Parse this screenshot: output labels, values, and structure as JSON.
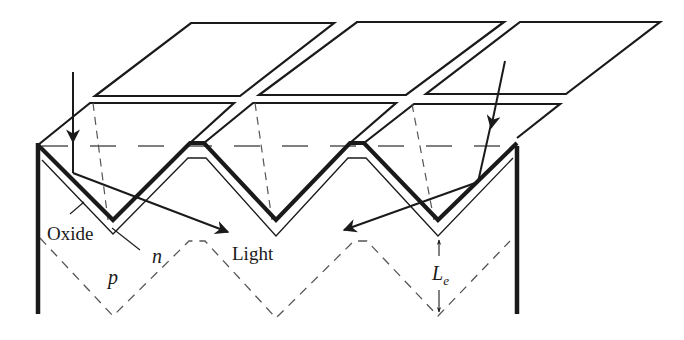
{
  "diagram": {
    "labels": {
      "oxide": "Oxide",
      "n_region": "n",
      "p_region": "p",
      "light": "Light",
      "diffusion_length_main": "L",
      "diffusion_length_sub": "e"
    },
    "elements": [
      "top-glass-plates-row-1",
      "top-glass-plates-row-2",
      "textured-surface-thick-zigzag",
      "oxide-layer-thin-zigzag",
      "pn-junction-dashed-zigzag",
      "horizontal-dashed-reference-line",
      "left-side-wall",
      "right-side-wall",
      "incident-light-ray-left",
      "incident-light-ray-right",
      "diffusion-length-arrows"
    ],
    "colors": {
      "stroke": "#1a1a1a",
      "background": "#ffffff",
      "dashed": "#555555"
    }
  }
}
